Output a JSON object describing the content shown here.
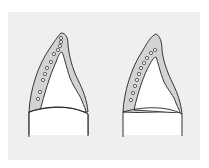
{
  "figure": {
    "colors": {
      "background": "#ffffff",
      "panel": "#efefef",
      "shaded_layer": "#d3d3d3",
      "inner": "#ffffff",
      "stroke": "#222222"
    },
    "panels": [
      {
        "id": "left",
        "circle_count": 11
      },
      {
        "id": "right",
        "circle_count": 10
      }
    ]
  }
}
